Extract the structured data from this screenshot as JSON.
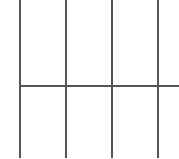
{
  "grid": {
    "background": "#ffffff",
    "line_color": "#555555",
    "vertical_lines_x": [
      19,
      65,
      111,
      157
    ],
    "horizontal_lines_y": [
      85
    ],
    "horizontal_line_start_x": 20,
    "vertical_line_bottom_y": 158
  }
}
